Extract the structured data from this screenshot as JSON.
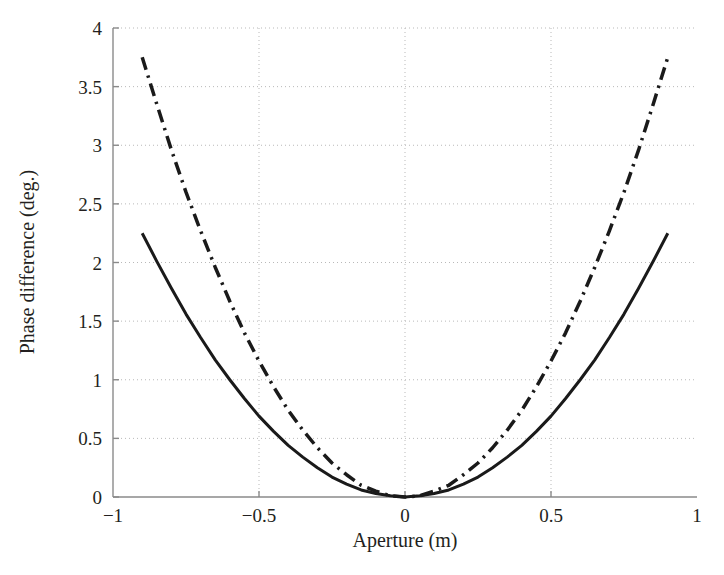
{
  "figure": {
    "background_color": "#ffffff",
    "axis_color": "#8a8a8a",
    "grid_color": "#b9b9b9",
    "text_color": "#231f20",
    "curve_color": "#1a1a1a"
  },
  "chart_data": {
    "type": "line",
    "title": "",
    "xlabel": "Aperture (m)",
    "ylabel": "Phase difference (deg.)",
    "xlim": [
      -1,
      1
    ],
    "ylim": [
      0,
      4
    ],
    "xticks": [
      -1,
      -0.5,
      0,
      0.5,
      1
    ],
    "xtick_labels": [
      "−1",
      "−0.5",
      "0",
      "0.5",
      "1"
    ],
    "yticks": [
      0,
      0.5,
      1,
      1.5,
      2,
      2.5,
      3,
      3.5,
      4
    ],
    "ytick_labels": [
      "0",
      "0.5",
      "1",
      "1.5",
      "2",
      "2.5",
      "3",
      "3.5",
      "4"
    ],
    "grid": true,
    "grid_style": "dotted",
    "legend": null,
    "legend_position": "none",
    "x": [
      -0.9,
      -0.85,
      -0.8,
      -0.75,
      -0.7,
      -0.65,
      -0.6,
      -0.55,
      -0.5,
      -0.45,
      -0.4,
      -0.35,
      -0.3,
      -0.25,
      -0.2,
      -0.15,
      -0.1,
      -0.05,
      0.0,
      0.05,
      0.1,
      0.15,
      0.2,
      0.25,
      0.3,
      0.35,
      0.4,
      0.45,
      0.5,
      0.55,
      0.6,
      0.65,
      0.7,
      0.75,
      0.8,
      0.85,
      0.9
    ],
    "series": [
      {
        "name": "solid-curve",
        "style": "solid",
        "color": "#1a1a1a",
        "linewidth": 3,
        "values": [
          2.25,
          2.01,
          1.78,
          1.56,
          1.36,
          1.17,
          1.0,
          0.84,
          0.69,
          0.56,
          0.44,
          0.34,
          0.25,
          0.17,
          0.11,
          0.06,
          0.03,
          0.01,
          0.0,
          0.01,
          0.03,
          0.06,
          0.11,
          0.17,
          0.25,
          0.34,
          0.44,
          0.56,
          0.69,
          0.84,
          1.0,
          1.17,
          1.36,
          1.56,
          1.78,
          2.01,
          2.25
        ]
      },
      {
        "name": "dash-dot-curve",
        "style": "dashdot",
        "color": "#1a1a1a",
        "linewidth": 3.5,
        "values": [
          3.75,
          3.35,
          2.96,
          2.6,
          2.27,
          1.96,
          1.67,
          1.4,
          1.16,
          0.94,
          0.74,
          0.57,
          0.42,
          0.29,
          0.19,
          0.1,
          0.05,
          0.01,
          0.0,
          0.01,
          0.05,
          0.1,
          0.19,
          0.29,
          0.42,
          0.57,
          0.74,
          0.94,
          1.16,
          1.4,
          1.67,
          1.96,
          2.27,
          2.6,
          2.96,
          3.35,
          3.75
        ]
      }
    ]
  }
}
